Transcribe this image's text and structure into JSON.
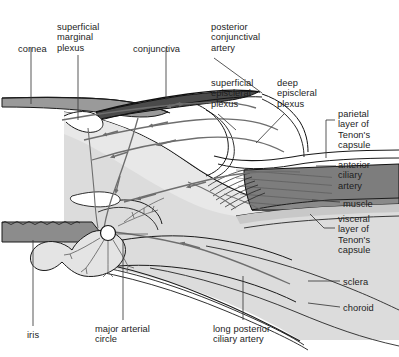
{
  "figure": {
    "type": "anatomical-cross-section",
    "background_color": "#ffffff",
    "ink_color": "#1d1d1d"
  },
  "palette": {
    "cornea_fill": "#9a9a9a",
    "conjunctiva_fill": "#4a4a4a",
    "sclera_fill": "#d8d8d8",
    "sclera_fill_light": "#e6e6e6",
    "muscle_fill": "#7d7d7d",
    "iris_fill": "#8c8c8c",
    "vessel_color": "#6e6e6e",
    "outline_color": "#1a1a1a",
    "leader_color": "#3a3a3a"
  },
  "labels": [
    {
      "id": "cornea",
      "text": "cornea",
      "x": 18,
      "y": 44,
      "lines": [
        "cornea"
      ]
    },
    {
      "id": "superficial-marginal-plexus",
      "text": "superficial marginal plexus",
      "x": 57,
      "y": 22,
      "lines": [
        "superficial",
        "marginal",
        "plexus"
      ]
    },
    {
      "id": "conjunctiva",
      "text": "conjunctiva",
      "x": 133,
      "y": 44,
      "lines": [
        "conjunctiva"
      ]
    },
    {
      "id": "posterior-conjunctival-artery",
      "text": "posterior conjunctival artery",
      "x": 211,
      "y": 22,
      "lines": [
        "posterior",
        "conjunctival",
        "artery"
      ]
    },
    {
      "id": "superficial-episcleral-plexus",
      "text": "superficial episcleral plexus",
      "x": 211,
      "y": 78,
      "lines": [
        "superficial",
        "episcleral",
        "plexus"
      ]
    },
    {
      "id": "deep-episcleral-plexus",
      "text": "deep episcleral plexus",
      "x": 277,
      "y": 78,
      "lines": [
        "deep",
        "episcleral",
        "plexus"
      ]
    },
    {
      "id": "parietal-layer-tenons-capsule",
      "text": "parietal layer of Tenon's capsule",
      "x": 338,
      "y": 109,
      "lines": [
        "parietal",
        "layer of",
        "Tenon's",
        "capsule"
      ]
    },
    {
      "id": "anterior-ciliary-artery",
      "text": "anterior ciliary artery",
      "x": 338,
      "y": 160,
      "lines": [
        "anterior",
        "ciliary",
        "artery"
      ]
    },
    {
      "id": "muscle",
      "text": "muscle",
      "x": 343,
      "y": 199,
      "lines": [
        "muscle"
      ]
    },
    {
      "id": "visceral-layer-tenons-capsule",
      "text": "visceral layer of Tenon's capsule",
      "x": 338,
      "y": 214,
      "lines": [
        "visceral",
        "layer of",
        "Tenon's",
        "capsule"
      ]
    },
    {
      "id": "sclera",
      "text": "sclera",
      "x": 343,
      "y": 277,
      "lines": [
        "sclera"
      ]
    },
    {
      "id": "choroid",
      "text": "choroid",
      "x": 343,
      "y": 303,
      "lines": [
        "choroid"
      ]
    },
    {
      "id": "iris",
      "text": "iris",
      "x": 27,
      "y": 330,
      "lines": [
        "iris"
      ]
    },
    {
      "id": "major-arterial-circle",
      "text": "major arterial circle",
      "x": 95,
      "y": 324,
      "lines": [
        "major arterial",
        "circle"
      ]
    },
    {
      "id": "long-posterior-ciliary-artery",
      "text": "long posterior ciliary artery",
      "x": 213,
      "y": 324,
      "lines": [
        "long posterior",
        "ciliary artery"
      ]
    }
  ],
  "structures": [
    {
      "id": "cornea-band",
      "name": "cornea",
      "description": "horizontal gray band at upper left"
    },
    {
      "id": "conjunctiva-band",
      "name": "conjunctiva",
      "description": "dark sloping band over the anterior sclera"
    },
    {
      "id": "sclera-body",
      "name": "sclera",
      "description": "large light gray wedge forming the globe wall"
    },
    {
      "id": "choroid-layer",
      "name": "choroid",
      "description": "thin layer lining the inner sclera"
    },
    {
      "id": "rectus-muscle",
      "name": "muscle",
      "description": "dark gray rectus muscle block with tendon fibers inserting on sclera"
    },
    {
      "id": "iris-body",
      "name": "iris",
      "description": "gray scalloped iris at lower left"
    },
    {
      "id": "major-arterial-circle-node",
      "name": "major arterial circle",
      "description": "small open circle at the iris root with radiating branches"
    },
    {
      "id": "vessel-network",
      "name": "vessel network",
      "description": "gray arrowed vessels of the episcleral and conjunctival plexuses"
    }
  ]
}
